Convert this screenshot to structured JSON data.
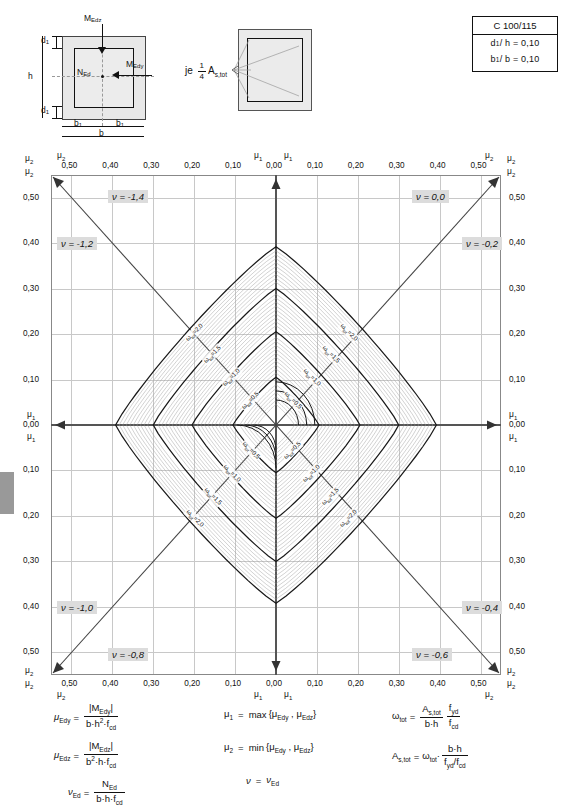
{
  "figure": {
    "cross_section": {
      "name": "rectangular-cross-section",
      "labels": {
        "m_edz": "M",
        "m_edz_sub": "Edz",
        "m_edy": "M",
        "m_edy_sub": "Edy",
        "n_ed": "N",
        "n_ed_sub": "Ed",
        "d1_top": "d",
        "d1_sub": "1",
        "h": "h",
        "b1_left": "b",
        "b1_sub": "1",
        "b": "b"
      }
    },
    "reinforcement_note": {
      "name": "reinforcement-note",
      "prefix": "je",
      "fraction_num": "1",
      "fraction_den": "4",
      "symbol": "A",
      "symbol_sub": "s,tot"
    }
  },
  "infobox": {
    "concrete_class": "C 100/115",
    "rows": [
      {
        "label": "d",
        "sub": "1",
        "rest": "/ h  =  0,10"
      },
      {
        "label": "b",
        "sub": "1",
        "rest": "/ b  =  0,10"
      }
    ]
  },
  "chart_data": {
    "type": "line",
    "xlabel": "mu1 / mu2",
    "ylabel": "mu1 / mu2",
    "axis_ticks": [
      "0,50",
      "0,40",
      "0,30",
      "0,20",
      "0,10",
      "0,00",
      "0,10",
      "0,20",
      "0,30",
      "0,40",
      "0,50"
    ],
    "tick_values": [
      -0.5,
      -0.4,
      -0.3,
      -0.2,
      -0.1,
      0.0,
      0.1,
      0.2,
      0.3,
      0.4,
      0.5
    ],
    "axis_range": [
      -0.55,
      0.55
    ],
    "grid": true,
    "mu_labels": {
      "mu1": "μ",
      "mu1_sub": "1",
      "mu2": "μ",
      "mu2_sub": "2",
      "zero": "0,00"
    },
    "nu_lines": [
      {
        "label": "ν = -1,4",
        "value": -1.4,
        "corner": "top-left-outer",
        "x": 108,
        "y": 190
      },
      {
        "label": "ν = -1,2",
        "value": -1.2,
        "corner": "top-left-inner",
        "x": 57,
        "y": 237
      },
      {
        "label": "ν = 0,0",
        "value": 0.0,
        "corner": "top-right-outer",
        "x": 412,
        "y": 190
      },
      {
        "label": "ν = -0,2",
        "value": -0.2,
        "corner": "top-right-inner",
        "x": 462,
        "y": 237
      },
      {
        "label": "ν = -1,0",
        "value": -1.0,
        "corner": "bottom-left-inner",
        "x": 57,
        "y": 601
      },
      {
        "label": "ν = -0,8",
        "value": -0.8,
        "corner": "bottom-left-outer",
        "x": 108,
        "y": 648
      },
      {
        "label": "ν = -0,4",
        "value": -0.4,
        "corner": "bottom-right-inner",
        "x": 462,
        "y": 601
      },
      {
        "label": "ν = -0,6",
        "value": -0.6,
        "corner": "bottom-right-outer",
        "x": 412,
        "y": 648
      }
    ],
    "omega_series": [
      {
        "name": "ωtot = 0,5",
        "value": 0.5,
        "extent": 0.105
      },
      {
        "name": "ωtot = 1,0",
        "value": 1.0,
        "extent": 0.205
      },
      {
        "name": "ωtot = 1,5",
        "value": 1.5,
        "extent": 0.3
      },
      {
        "name": "ωtot = 2,0",
        "value": 2.0,
        "extent": 0.392
      }
    ],
    "omega_label_prefix": "ω",
    "omega_label_sub": "tot",
    "omega_label_values": [
      "0,5",
      "1,0",
      "1,5",
      "2,0"
    ],
    "intermediate_curve_count": 9
  },
  "formulas": {
    "left": [
      {
        "lhs": "μ",
        "lhs_sub": "Edy",
        "num": "|M",
        "num_sub": "Edy",
        "num_end": "|",
        "den": "b·h²·f",
        "den_sub": "cd"
      },
      {
        "lhs": "μ",
        "lhs_sub": "Edz",
        "num": "|M",
        "num_sub": "Edz",
        "num_end": "|",
        "den": "b²·h·f",
        "den_sub": "cd"
      },
      {
        "lhs": "ν",
        "lhs_sub": "Ed",
        "num": "N",
        "num_sub": "Ed",
        "num_end": "",
        "den": "b·h·f",
        "den_sub": "cd"
      }
    ],
    "middle": [
      {
        "text": "μ₁  =  max {μ_Edy , μ_Edz}",
        "lhs": "μ",
        "lhs_sub": "1",
        "op": "max",
        "a": "μ",
        "a_sub": "Edy",
        "b": "μ",
        "b_sub": "Edz"
      },
      {
        "text": "μ₂  =  min {μ_Edy , μ_Edz}",
        "lhs": "μ",
        "lhs_sub": "2",
        "op": "min",
        "a": "μ",
        "a_sub": "Edy",
        "b": "μ",
        "b_sub": "Edz"
      },
      {
        "text": "ν  =  ν_Ed",
        "lhs": "ν",
        "lhs_sub": "",
        "op": "",
        "a": "ν",
        "a_sub": "Ed",
        "b": "",
        "b_sub": ""
      }
    ],
    "right": [
      {
        "lhs": "ω",
        "lhs_sub": "tot",
        "n1": "A",
        "n1_sub": "s,tot",
        "d1": "b·h",
        "n2": "f",
        "n2_sub": "yd",
        "d2": "f",
        "d2_sub": "cd"
      },
      {
        "lhs": "A",
        "lhs_sub": "s,tot",
        "rhs_pre": "ω",
        "rhs_pre_sub": "tot",
        "n1": "b·h",
        "d1": "f",
        "d1_sub": "yd",
        "d1_rest": "/f",
        "d1_sub2": "cd"
      }
    ]
  }
}
